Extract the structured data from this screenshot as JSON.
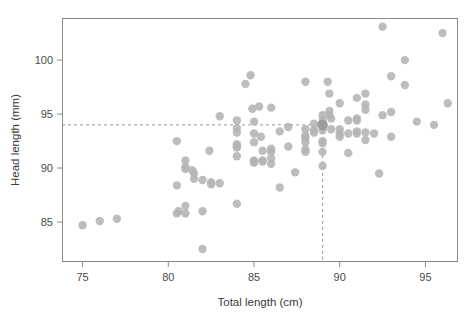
{
  "chart_data": {
    "type": "scatter",
    "title": "",
    "xlabel": "Total length (cm)",
    "ylabel": "Head length (mm)",
    "xlim": [
      73.8,
      96.9
    ],
    "ylim": [
      81.3,
      103.9
    ],
    "xticks": [
      75,
      80,
      85,
      90,
      95
    ],
    "xticklabels": [
      "75",
      "80",
      "85",
      "90",
      "95"
    ],
    "yticks": [
      85,
      90,
      95,
      100
    ],
    "yticklabels": [
      "85",
      "90",
      "95",
      "100"
    ],
    "grid": false,
    "legend": null,
    "marker_color": "#b4b4b4",
    "marker_size": 4.2,
    "frame_color": "#8a8a8a",
    "annotations": [
      {
        "name": "horizontal-guide",
        "type": "hline",
        "y": 94.0,
        "style": "dashed",
        "color": "#9a9a9a"
      },
      {
        "name": "vertical-guide",
        "type": "vline",
        "x": 89.0,
        "style": "dashed",
        "color": "#9a9a9a"
      },
      {
        "name": "highlighted-point",
        "type": "point",
        "x": 89.0,
        "y": 94.0,
        "color": "#9a9a9a"
      }
    ],
    "points": [
      [
        75.0,
        84.7
      ],
      [
        76.0,
        85.1
      ],
      [
        77.0,
        85.3
      ],
      [
        80.5,
        92.5
      ],
      [
        80.5,
        88.4
      ],
      [
        80.5,
        85.8
      ],
      [
        80.6,
        86.0
      ],
      [
        81.0,
        90.7
      ],
      [
        81.0,
        90.1
      ],
      [
        81.0,
        89.9
      ],
      [
        81.0,
        86.5
      ],
      [
        81.0,
        85.8
      ],
      [
        81.4,
        89.8
      ],
      [
        81.5,
        89.5
      ],
      [
        81.5,
        89.0
      ],
      [
        82.0,
        88.9
      ],
      [
        82.0,
        82.5
      ],
      [
        82.0,
        86.0
      ],
      [
        82.4,
        91.6
      ],
      [
        82.5,
        88.7
      ],
      [
        82.5,
        88.5
      ],
      [
        83.0,
        94.8
      ],
      [
        83.0,
        88.6
      ],
      [
        84.0,
        94.4
      ],
      [
        84.0,
        93.7
      ],
      [
        84.0,
        93.3
      ],
      [
        84.0,
        92.2
      ],
      [
        84.0,
        92.0
      ],
      [
        84.0,
        91.9
      ],
      [
        84.0,
        86.7
      ],
      [
        84.0,
        91.1
      ],
      [
        84.5,
        97.8
      ],
      [
        84.8,
        98.6
      ],
      [
        84.9,
        95.5
      ],
      [
        85.0,
        94.3
      ],
      [
        85.0,
        93.2
      ],
      [
        85.0,
        92.4
      ],
      [
        85.0,
        90.7
      ],
      [
        85.0,
        90.6
      ],
      [
        85.0,
        90.5
      ],
      [
        85.3,
        95.7
      ],
      [
        85.4,
        92.9
      ],
      [
        85.5,
        91.6
      ],
      [
        85.5,
        90.7
      ],
      [
        85.5,
        90.6
      ],
      [
        86.0,
        95.6
      ],
      [
        86.0,
        91.8
      ],
      [
        86.0,
        91.5
      ],
      [
        86.0,
        90.9
      ],
      [
        86.0,
        90.4
      ],
      [
        86.5,
        93.4
      ],
      [
        86.5,
        88.2
      ],
      [
        87.0,
        93.8
      ],
      [
        87.0,
        92.0
      ],
      [
        87.4,
        89.6
      ],
      [
        88.0,
        98.0
      ],
      [
        88.0,
        93.6
      ],
      [
        88.0,
        93.0
      ],
      [
        88.0,
        92.8
      ],
      [
        88.0,
        92.4
      ],
      [
        88.0,
        91.7
      ],
      [
        88.0,
        91.5
      ],
      [
        88.5,
        94.1
      ],
      [
        88.5,
        93.5
      ],
      [
        88.5,
        93.3
      ],
      [
        89.0,
        94.9
      ],
      [
        89.0,
        94.4
      ],
      [
        89.0,
        94.0
      ],
      [
        89.0,
        93.9
      ],
      [
        89.0,
        93.5
      ],
      [
        89.0,
        92.5
      ],
      [
        89.0,
        92.3
      ],
      [
        89.0,
        91.5
      ],
      [
        89.0,
        90.2
      ],
      [
        89.3,
        98.0
      ],
      [
        89.4,
        96.9
      ],
      [
        89.4,
        95.3
      ],
      [
        89.4,
        94.9
      ],
      [
        89.5,
        94.6
      ],
      [
        89.5,
        93.6
      ],
      [
        90.0,
        96.0
      ],
      [
        90.0,
        93.6
      ],
      [
        90.0,
        93.2
      ],
      [
        90.0,
        92.9
      ],
      [
        90.5,
        94.4
      ],
      [
        90.5,
        93.2
      ],
      [
        90.5,
        91.4
      ],
      [
        91.0,
        96.5
      ],
      [
        91.0,
        94.6
      ],
      [
        91.0,
        94.4
      ],
      [
        91.0,
        93.4
      ],
      [
        91.0,
        93.2
      ],
      [
        91.5,
        96.9
      ],
      [
        91.5,
        95.9
      ],
      [
        91.5,
        95.4
      ],
      [
        91.5,
        93.3
      ],
      [
        91.5,
        92.6
      ],
      [
        92.0,
        93.2
      ],
      [
        92.3,
        89.5
      ],
      [
        92.5,
        103.1
      ],
      [
        92.5,
        94.9
      ],
      [
        93.0,
        98.5
      ],
      [
        93.0,
        95.2
      ],
      [
        93.0,
        92.9
      ],
      [
        93.8,
        100.0
      ],
      [
        93.8,
        97.7
      ],
      [
        94.5,
        94.3
      ],
      [
        95.5,
        94.0
      ],
      [
        96.0,
        102.5
      ],
      [
        96.3,
        96.0
      ]
    ]
  },
  "plot_geometry": {
    "left": 62,
    "right": 458,
    "top": 18,
    "bottom": 262
  }
}
